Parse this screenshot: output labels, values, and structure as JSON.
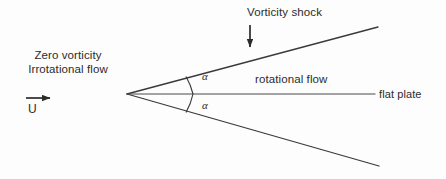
{
  "figure": {
    "title_text_present": false,
    "background_color": "#fdfdfd",
    "line_color": "#3a3a3a",
    "text_color": "#2b2b2b"
  },
  "labels": {
    "inflow_line1": "Zero vorticity",
    "inflow_line2": "Irrotational flow",
    "velocity": "U",
    "vorticity_shock": "Vorticity shock",
    "rotational_flow": "rotational flow",
    "flat_plate": "flat plate",
    "alpha_upper": "α",
    "alpha_lower": "α"
  },
  "geometry": {
    "apex": {
      "x": 127,
      "y": 94
    },
    "upper_shock_end": {
      "x": 378,
      "y": 27
    },
    "lower_shock_end": {
      "x": 379,
      "y": 166
    },
    "plate_line_start": {
      "x": 127,
      "y": 94
    },
    "plate_line_end": {
      "x": 375,
      "y": 94
    },
    "inflow_arrow": {
      "x1": 26,
      "y1": 98,
      "x2": 56,
      "y2": 98
    },
    "shock_pointer_arrow": {
      "x1": 250,
      "y1": 27,
      "x2": 250,
      "y2": 53
    },
    "angle_arc_radius": 66
  }
}
